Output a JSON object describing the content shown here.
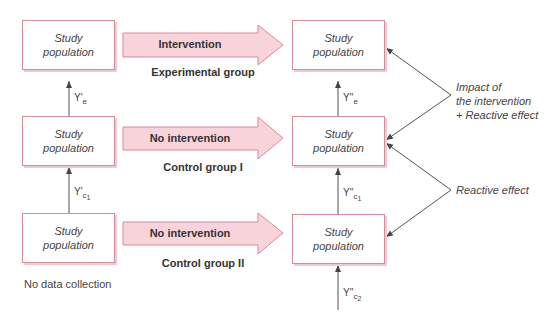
{
  "colors": {
    "box_border": "#d98a98",
    "box_shadow": "#f2c9d2",
    "arrow_fill": "#f9d3da",
    "arrow_stroke": "#d98a98",
    "line": "#555555"
  },
  "boxes": {
    "pre_experimental": {
      "line1": "Study",
      "line2": "population"
    },
    "pre_control1": {
      "line1": "Study",
      "line2": "population"
    },
    "pre_control2": {
      "line1": "Study",
      "line2": "population"
    },
    "post_experimental": {
      "line1": "Study",
      "line2": "population"
    },
    "post_control1": {
      "line1": "Study",
      "line2": "population"
    },
    "post_control2": {
      "line1": "Study",
      "line2": "population"
    }
  },
  "arrows": [
    {
      "label": "Intervention",
      "group": "Experimental group"
    },
    {
      "label": "No intervention",
      "group": "Control group I"
    },
    {
      "label": "No intervention",
      "group": "Control group II"
    }
  ],
  "measurements": {
    "pre_e": {
      "base": "Y'",
      "sub": "e",
      "subsub": ""
    },
    "pre_c1": {
      "base": "Y'",
      "sub": "c",
      "subsub": "1"
    },
    "post_e": {
      "base": "Y''",
      "sub": "e",
      "subsub": ""
    },
    "post_c1": {
      "base": "Y''",
      "sub": "c",
      "subsub": "1"
    },
    "post_c2": {
      "base": "Y''",
      "sub": "c",
      "subsub": "2"
    }
  },
  "annotations": {
    "impact": {
      "line1": "Impact of",
      "line2": "the intervention",
      "line3": "+ Reactive effect"
    },
    "reactive": "Reactive effect",
    "no_data": "No data collection"
  }
}
